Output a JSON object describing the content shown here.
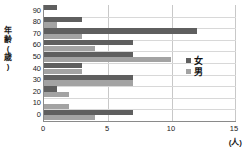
{
  "axes": {
    "y_title": "年齢(歳)",
    "y_title_chars": [
      "年",
      "齢",
      "(",
      "歳",
      ")"
    ],
    "y_ticks": [
      "90",
      "80",
      "70",
      "60",
      "50",
      "40",
      "30",
      "20",
      "10",
      "0"
    ],
    "x_ticks": [
      "0",
      "5",
      "10",
      "15"
    ],
    "x_unit_label": "(人)"
  },
  "legend": {
    "items": [
      {
        "label": "女",
        "color": "#5f5f5f"
      },
      {
        "label": "男",
        "color": "#a3a3a3"
      }
    ]
  },
  "colors": {
    "female": "#5f5f5f",
    "male": "#a3a3a3",
    "grid": "#c8c8c8",
    "axis": "#8a8a8a",
    "background": "#ffffff"
  },
  "chart_data": {
    "type": "bar",
    "orientation": "horizontal",
    "title": "",
    "xlabel": "(人)",
    "ylabel": "年齢(歳)",
    "xlim": [
      0,
      15
    ],
    "grid": true,
    "legend_position": "right-middle",
    "categories": [
      "90",
      "80",
      "70",
      "60",
      "50",
      "40",
      "30",
      "20",
      "10",
      "0"
    ],
    "series": [
      {
        "name": "女",
        "color": "#5f5f5f",
        "values": [
          1,
          3,
          12,
          7,
          7,
          3,
          7,
          1,
          0,
          7
        ]
      },
      {
        "name": "男",
        "color": "#a3a3a3",
        "values": [
          0,
          1,
          3,
          4,
          10,
          3,
          7,
          2,
          2,
          4
        ]
      }
    ],
    "xticks": [
      0,
      5,
      10,
      15
    ]
  }
}
